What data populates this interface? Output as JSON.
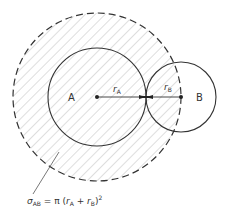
{
  "diagram": {
    "type": "collision-cross-section",
    "colors": {
      "stroke": "#333333",
      "hatch": "#bdbdbd",
      "background": "#ffffff"
    },
    "circle_a": {
      "label": "A",
      "cx": 97,
      "cy": 97,
      "r": 49
    },
    "circle_b": {
      "label": "B",
      "cx": 181,
      "cy": 97,
      "r": 35
    },
    "cross_section": {
      "cx": 97,
      "cy": 97,
      "r": 84,
      "style": "dashed, hatched"
    },
    "radius_a_label": {
      "main": "r",
      "sub": "A"
    },
    "radius_b_label": {
      "main": "r",
      "sub": "B"
    },
    "formula": {
      "sigma": "σ",
      "sigma_sub": "AB",
      "equals": " = π (",
      "ra": "r",
      "ra_sub": "A",
      "plus": " + ",
      "rb": "r",
      "rb_sub": "B",
      "close": ")",
      "sup": "2"
    }
  }
}
